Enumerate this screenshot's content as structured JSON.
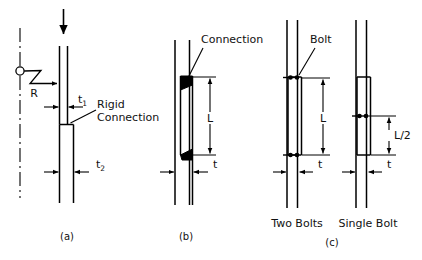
{
  "figure": {
    "background_color": "#ffffff",
    "line_color": "#000000",
    "panels": [
      {
        "id": "a",
        "caption": "(a)",
        "name": "rigid-connection-panel",
        "labels": {
          "load_arrow": "load-arrow",
          "spring_label": "R",
          "thickness_upper": "t",
          "thickness_upper_sub": "1",
          "thickness_lower": "t",
          "thickness_lower_sub": "2",
          "connection_line1": "Rigid",
          "connection_line2": "Connection"
        }
      },
      {
        "id": "b",
        "caption": "(b)",
        "name": "welded-connection-panel",
        "labels": {
          "connection": "Connection",
          "length": "L",
          "thickness": "t"
        }
      },
      {
        "id": "c",
        "caption": "(c)",
        "name": "bolted-connection-panel",
        "labels": {
          "bolt": "Bolt",
          "length_two_bolts": "L",
          "length_single_bolt": "L/2",
          "thickness_two_bolts": "t",
          "thickness_single_bolt": "t",
          "variant_two": "Two Bolts",
          "variant_single": "Single Bolt"
        }
      }
    ]
  }
}
